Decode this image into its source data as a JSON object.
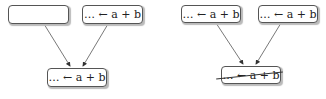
{
  "diagram": {
    "left_panel": {
      "top_boxes": [
        {
          "label": ""
        },
        {
          "label": "… ← a + b"
        }
      ],
      "bottom_box": {
        "label": "… ← a + b",
        "struck_out": false
      }
    },
    "right_panel": {
      "top_boxes": [
        {
          "label": "… ← a + b"
        },
        {
          "label": "… ← a + b"
        }
      ],
      "bottom_box": {
        "label": "… ← a + b",
        "struck_out": true
      }
    }
  }
}
